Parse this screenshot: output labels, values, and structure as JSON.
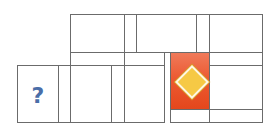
{
  "puzzle": {
    "mystery_cell": {
      "label": "?",
      "color": "#4a6ea8"
    },
    "highlighted_tile": {
      "icon": "diamond-icon",
      "tile_color": "#e8532a",
      "diamond_color": "#f6c945"
    },
    "grid_line_color": "#6b6b6b"
  }
}
